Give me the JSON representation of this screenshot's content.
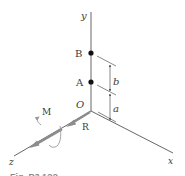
{
  "diagram": {
    "type": "3d-coordinate-statics",
    "axes": {
      "x": {
        "label": "x"
      },
      "y": {
        "label": "y"
      },
      "z": {
        "label": "z"
      }
    },
    "origin": {
      "label": "O"
    },
    "points": [
      {
        "id": "B",
        "label": "B"
      },
      {
        "id": "A",
        "label": "A"
      }
    ],
    "dimensions": [
      {
        "id": "b",
        "label": "b",
        "between": [
          "A",
          "B"
        ]
      },
      {
        "id": "a",
        "label": "a",
        "between": [
          "O",
          "A"
        ]
      }
    ],
    "force": {
      "label": "R",
      "direction": "along +z"
    },
    "moment": {
      "label": "M",
      "about": "z-axis"
    },
    "caption": {
      "text": "Fig. P3.1??",
      "note": "partially cropped"
    },
    "colors": {
      "line": "#555555",
      "force_arrow": "#8c8c8c",
      "moment_curve": "#9a9a9a",
      "point": "#111111",
      "text": "#3a3a3a"
    }
  }
}
